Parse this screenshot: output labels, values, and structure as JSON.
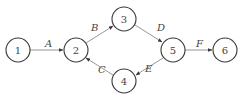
{
  "diagram": {
    "type": "directed-graph",
    "colors": {
      "node_stroke": "#3a3a3a",
      "edge_stroke": "#8a8a8a",
      "text": "#444444"
    },
    "nodes": [
      {
        "id": "1",
        "label": "1",
        "x": 18,
        "y": 50
      },
      {
        "id": "2",
        "label": "2",
        "x": 76,
        "y": 50
      },
      {
        "id": "3",
        "label": "3",
        "x": 124,
        "y": 19
      },
      {
        "id": "4",
        "label": "4",
        "x": 124,
        "y": 81
      },
      {
        "id": "5",
        "label": "5",
        "x": 173,
        "y": 50
      },
      {
        "id": "6",
        "label": "6",
        "x": 225,
        "y": 50
      }
    ],
    "edges": [
      {
        "from": "1",
        "to": "2",
        "label": "A"
      },
      {
        "from": "2",
        "to": "3",
        "label": "B"
      },
      {
        "from": "3",
        "to": "5",
        "label": "D"
      },
      {
        "from": "5",
        "to": "6",
        "label": "F"
      },
      {
        "from": "5",
        "to": "4",
        "label": "E"
      },
      {
        "from": "4",
        "to": "2",
        "label": "C"
      }
    ]
  }
}
